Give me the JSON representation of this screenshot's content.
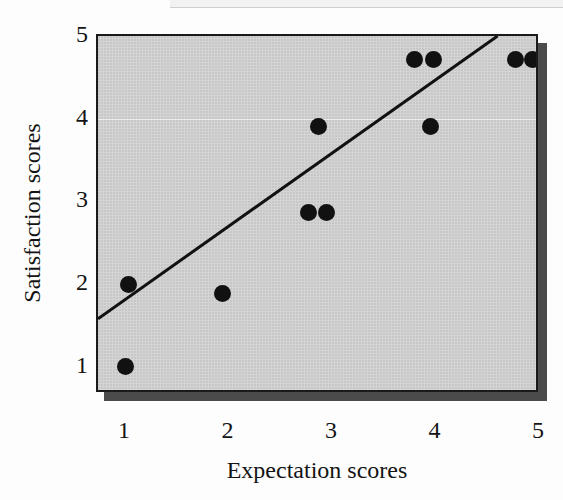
{
  "chart_data": {
    "type": "scatter",
    "title": "",
    "xlabel": "Expectation scores",
    "ylabel": "Satisfaction scores",
    "xlim": [
      0.73,
      5.0
    ],
    "ylim": [
      0.67,
      5.0
    ],
    "xticks": [
      1,
      2,
      3,
      4,
      5
    ],
    "yticks": [
      1,
      2,
      3,
      4,
      5
    ],
    "xtick_labels": [
      "1",
      "2",
      "3",
      "4",
      "5"
    ],
    "ytick_labels": [
      "1",
      "2",
      "3",
      "4",
      "5"
    ],
    "grid": false,
    "legend": null,
    "points": [
      {
        "x": 1.0,
        "y": 1.0
      },
      {
        "x": 1.02,
        "y": 2.0
      },
      {
        "x": 1.93,
        "y": 1.88
      },
      {
        "x": 2.76,
        "y": 2.86
      },
      {
        "x": 2.94,
        "y": 2.86
      },
      {
        "x": 2.86,
        "y": 3.9
      },
      {
        "x": 3.79,
        "y": 4.72
      },
      {
        "x": 3.97,
        "y": 4.72
      },
      {
        "x": 3.94,
        "y": 3.9
      },
      {
        "x": 4.76,
        "y": 4.72
      },
      {
        "x": 4.93,
        "y": 4.72
      }
    ],
    "trendline": {
      "type": "linear-fit",
      "x_start": 0.73,
      "y_start": 1.58,
      "x_end": 4.59,
      "y_end": 5.0
    },
    "colors": {
      "plot_background": "#d4d4d4",
      "marker": "#111111",
      "axis": "#1a1a1a",
      "trendline": "#111111",
      "shadow": "#4b4b4b",
      "text": "#141414"
    }
  },
  "axes": {
    "y_title": "Satisfaction scores",
    "x_title": "Expectation scores",
    "y_labels": [
      "5",
      "4",
      "3",
      "2",
      "1"
    ],
    "x_labels": [
      "1",
      "2",
      "3",
      "4",
      "5"
    ]
  }
}
